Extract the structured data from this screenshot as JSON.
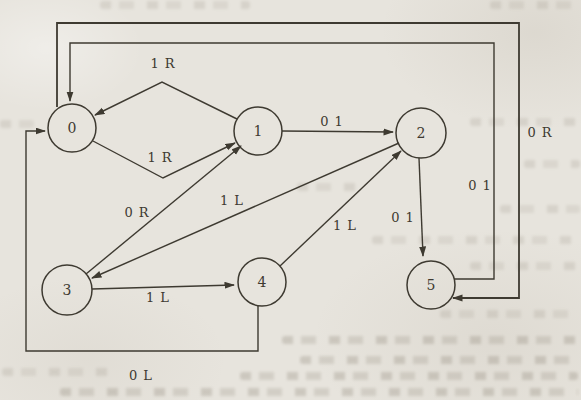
{
  "diagram": {
    "type": "turing-machine-state-transition-diagram",
    "colors": {
      "ink": "#3e3a31",
      "paper": "#e7e4dd"
    },
    "states": [
      {
        "label": "0"
      },
      {
        "label": "1"
      },
      {
        "label": "2"
      },
      {
        "label": "3"
      },
      {
        "label": "4"
      },
      {
        "label": "5"
      }
    ],
    "edges": [
      {
        "from": "1",
        "to": "0",
        "label": "1 R"
      },
      {
        "from": "0",
        "to": "1",
        "label": "1 R"
      },
      {
        "from": "1",
        "to": "2",
        "label": "0 1"
      },
      {
        "from": "3",
        "to": "1",
        "label": "0 R"
      },
      {
        "from": "2",
        "to": "3",
        "label": "1 L"
      },
      {
        "from": "4",
        "to": "2",
        "label": "1 L"
      },
      {
        "from": "3",
        "to": "4",
        "label": "1 L"
      },
      {
        "from": "2",
        "to": "5",
        "label": "0 1"
      },
      {
        "from": "4",
        "to": "0",
        "label": "0 L"
      },
      {
        "from": "0",
        "to": "5",
        "label": "0 R"
      },
      {
        "from": "5",
        "to": "0",
        "label": "0 1"
      }
    ]
  }
}
